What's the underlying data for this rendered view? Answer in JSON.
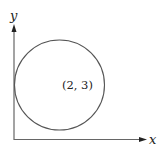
{
  "diagram": {
    "type": "coordinate-plane-with-circle",
    "axes": {
      "x_label": "x",
      "y_label": "y"
    },
    "circle": {
      "center_label": "(2, 3)",
      "center": [
        2,
        3
      ],
      "radius": 2,
      "tangent_to": "y-axis"
    },
    "colors": {
      "stroke": "#555555",
      "background": "#ffffff",
      "text": "#222222"
    }
  }
}
